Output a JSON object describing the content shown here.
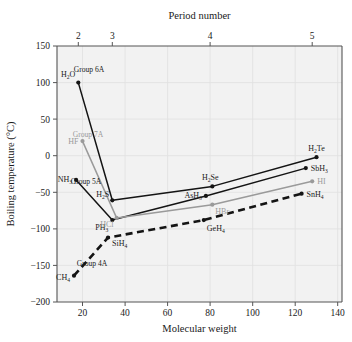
{
  "figure": {
    "top_axis_title": "Period number",
    "x_axis_title": "Molecular weight",
    "y_axis_title": "Boiling temperature (°C)",
    "background": "#f2f2f2",
    "frame_color": "#555555"
  },
  "axes": {
    "x_ticks": [
      "20",
      "40",
      "60",
      "80",
      "100",
      "120",
      "140"
    ],
    "x_tick_values": [
      20,
      40,
      60,
      80,
      100,
      120,
      140
    ],
    "y_ticks": [
      "150",
      "100",
      "50",
      "0",
      "−50",
      "−100",
      "−150",
      "−200"
    ],
    "y_tick_values": [
      150,
      100,
      50,
      0,
      -50,
      -100,
      -150,
      -200
    ],
    "period_ticks": [
      "2",
      "3",
      "4",
      "5"
    ],
    "period_tick_weights": [
      18,
      34,
      80,
      128
    ]
  },
  "colors": {
    "black": "#141414",
    "gray": "#9a9a9a",
    "grid": "#e2e2e2",
    "plot_bg": "#f2f2f2"
  },
  "chart_data": {
    "type": "line",
    "title": "",
    "subtitle": "",
    "xlabel": "Molecular weight",
    "ylabel": "Boiling temperature (°C)",
    "top_axis_label": "Period number",
    "xlim": [
      8,
      142
    ],
    "ylim": [
      -200,
      150
    ],
    "grid": true,
    "legend": "inline annotations",
    "series": [
      {
        "name": "Group 6A",
        "group_label": "Group 6A",
        "color": "#141414",
        "style": "solid",
        "marker": "circle",
        "points": [
          {
            "label": "H2O",
            "formula_main": "H",
            "formula_sub": "2",
            "formula_tail": "O",
            "x": 18,
            "y": 100
          },
          {
            "label": "H2S",
            "formula_main": "H",
            "formula_sub": "2",
            "formula_tail": "S",
            "x": 34,
            "y": -61
          },
          {
            "label": "H2Se",
            "formula_main": "H",
            "formula_sub": "2",
            "formula_tail": "Se",
            "x": 81,
            "y": -42
          },
          {
            "label": "H2Te",
            "formula_main": "H",
            "formula_sub": "2",
            "formula_tail": "Te",
            "x": 130,
            "y": -2
          }
        ]
      },
      {
        "name": "Group 5A",
        "group_label": "Group 5A",
        "color": "#141414",
        "style": "solid",
        "marker": "circle",
        "points": [
          {
            "label": "NH3",
            "formula_main": "NH",
            "formula_sub": "3",
            "formula_tail": "",
            "x": 17,
            "y": -33
          },
          {
            "label": "PH3",
            "formula_main": "PH",
            "formula_sub": "3",
            "formula_tail": "",
            "x": 34,
            "y": -88
          },
          {
            "label": "AsH3",
            "formula_main": "AsH",
            "formula_sub": "3",
            "formula_tail": "",
            "x": 78,
            "y": -55
          },
          {
            "label": "SbH3",
            "formula_main": "SbH",
            "formula_sub": "3",
            "formula_tail": "",
            "x": 125,
            "y": -17
          }
        ]
      },
      {
        "name": "Group 7A",
        "group_label": "Group 7A",
        "color": "#9a9a9a",
        "style": "solid",
        "marker": "circle",
        "points": [
          {
            "label": "HF",
            "formula_main": "HF",
            "formula_sub": "",
            "formula_tail": "",
            "x": 20,
            "y": 20
          },
          {
            "label": "HCl",
            "formula_main": "HCl",
            "formula_sub": "",
            "formula_tail": "",
            "x": 36,
            "y": -85
          },
          {
            "label": "HBr",
            "formula_main": "HBr",
            "formula_sub": "",
            "formula_tail": "",
            "x": 81,
            "y": -67
          },
          {
            "label": "HI",
            "formula_main": "HI",
            "formula_sub": "",
            "formula_tail": "",
            "x": 128,
            "y": -35
          }
        ]
      },
      {
        "name": "Group 4A",
        "group_label": "Group 4A",
        "color": "#141414",
        "style": "dashed",
        "marker": "circle",
        "points": [
          {
            "label": "CH4",
            "formula_main": "CH",
            "formula_sub": "4",
            "formula_tail": "",
            "x": 16,
            "y": -164
          },
          {
            "label": "SiH4",
            "formula_main": "SiH",
            "formula_sub": "4",
            "formula_tail": "",
            "x": 32,
            "y": -112
          },
          {
            "label": "GeH4",
            "formula_main": "GeH",
            "formula_sub": "4",
            "formula_tail": "",
            "x": 77,
            "y": -88
          },
          {
            "label": "SnH4",
            "formula_main": "SnH",
            "formula_sub": "4",
            "formula_tail": "",
            "x": 123,
            "y": -52
          }
        ]
      }
    ]
  },
  "annotations": {
    "group_6a": "Group 6A",
    "group_7a": "Group 7A",
    "group_5a": "Group 5A",
    "group_4a": "Group 4A"
  }
}
